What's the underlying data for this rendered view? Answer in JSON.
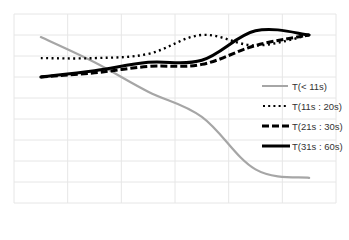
{
  "chart_data": {
    "type": "line",
    "title": "",
    "xlabel": "",
    "ylabel": "",
    "categories": [
      "1",
      "2",
      "3",
      "4",
      "5",
      "6"
    ],
    "ylim": [
      0,
      9
    ],
    "grid": true,
    "legend_position": "right",
    "series": [
      {
        "name": "T(< 11s)",
        "style": "solid-thin",
        "color": "#a6a6a6",
        "values": [
          7.9,
          6.7,
          5.3,
          4.1,
          1.6,
          1.2
        ]
      },
      {
        "name": "T(11s : 20s)",
        "style": "dotted",
        "color": "#000000",
        "values": [
          6.9,
          6.9,
          7.1,
          8.0,
          7.5,
          8.0
        ]
      },
      {
        "name": "T(21s : 30s)",
        "style": "dashed",
        "color": "#000000",
        "values": [
          6.0,
          6.2,
          6.5,
          6.6,
          7.5,
          8.0
        ]
      },
      {
        "name": "T(31s : 60s)",
        "style": "solid-thick",
        "color": "#000000",
        "values": [
          6.0,
          6.3,
          6.7,
          6.8,
          8.2,
          8.0
        ]
      }
    ]
  },
  "legend": {
    "items": [
      {
        "label": "T(< 11s)"
      },
      {
        "label": "T(11s : 20s)"
      },
      {
        "label": "T(21s : 30s)"
      },
      {
        "label": "T(31s : 60s)"
      }
    ]
  },
  "colors": {
    "grid": "#e6e6e6",
    "series_gray": "#a6a6a6",
    "series_black": "#000000"
  }
}
